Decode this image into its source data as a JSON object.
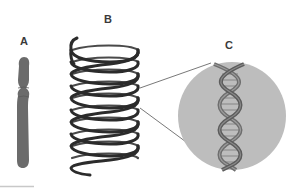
{
  "figure": {
    "panels": [
      {
        "id": "A",
        "label": "A",
        "subject": "chromosome"
      },
      {
        "id": "B",
        "label": "B",
        "subject": "coiled chromatin fiber"
      },
      {
        "id": "C",
        "label": "C",
        "subject": "DNA double helix (magnified)"
      }
    ],
    "colors": {
      "background": "#ffffff",
      "chromosome": "#6b6b6b",
      "coil": "#2b2b2b",
      "magnifier_circle": "#bdbdbd",
      "helix": "#7a7a7a",
      "zoom_lines": "#555555",
      "label_text": "#3a3a3a"
    }
  }
}
